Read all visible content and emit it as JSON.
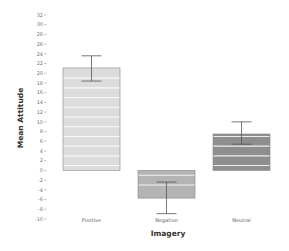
{
  "chart_data": {
    "type": "bar",
    "title": "",
    "xlabel": "Imagery",
    "ylabel": "Mean Attitude",
    "categories": [
      "Positive",
      "Negative",
      "Neutral"
    ],
    "values": [
      21.1,
      -5.7,
      7.5
    ],
    "error_bars": [
      {
        "upper": 23.6,
        "lower": 18.4
      },
      {
        "upper": -2.4,
        "lower": -8.9
      },
      {
        "upper": 10.0,
        "lower": 5.4
      }
    ],
    "colors": [
      "#dcdcdc",
      "#b4b4b4",
      "#8e8e8e"
    ],
    "ylim": [
      -10,
      32
    ],
    "yticks": [
      32,
      30,
      28,
      26,
      24,
      22,
      20,
      18,
      16,
      14,
      12,
      10,
      8,
      6,
      4,
      2,
      0,
      -2,
      -4,
      -6,
      -8,
      -10
    ],
    "grid": false,
    "legend": null
  }
}
